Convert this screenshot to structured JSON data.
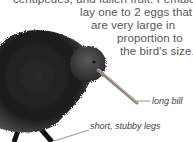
{
  "paragraph": {
    "lines": [
      "centipedes, and fallen fruit. Females",
      "lay one to 2 eggs that",
      "are very large in",
      "proportion to",
      "the bird's size."
    ]
  },
  "illustration": {
    "subject": "kiwi-bird",
    "labels": {
      "bill": "long bill",
      "legs": "short, stubby legs"
    }
  },
  "colors": {
    "text": "#555555",
    "bird_dark": "#1a1a1a",
    "bird_mid": "#3a3a3a",
    "bill": "#9a9080",
    "leader_line": "#666666"
  }
}
